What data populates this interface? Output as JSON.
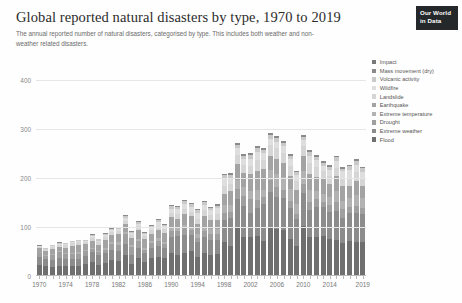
{
  "header": {
    "title": "Global reported natural disasters by type, 1970 to 2019",
    "subtitle": "The annual reported number of natural disasters, categorised by type. This includes both weather and non-weather related disasters.",
    "logo_line1": "Our World",
    "logo_line2": "in Data"
  },
  "chart_data": {
    "type": "bar",
    "stacked": true,
    "title": "Global reported natural disasters by type, 1970 to 2019",
    "subtitle": "The annual reported number of natural disasters, categorised by type. This includes both weather and non-weather related disasters.",
    "xlabel": "",
    "ylabel": "",
    "ylim": [
      0,
      440
    ],
    "yticks": [
      0,
      100,
      200,
      300,
      400
    ],
    "ytick_labels": [
      "0",
      "100",
      "200",
      "300",
      "400"
    ],
    "grid": true,
    "legend_position": "right",
    "categories": [
      1970,
      1971,
      1972,
      1973,
      1974,
      1975,
      1976,
      1977,
      1978,
      1979,
      1980,
      1981,
      1982,
      1983,
      1984,
      1985,
      1986,
      1987,
      1988,
      1989,
      1990,
      1991,
      1992,
      1993,
      1994,
      1995,
      1996,
      1997,
      1998,
      1999,
      2000,
      2001,
      2002,
      2003,
      2004,
      2005,
      2006,
      2007,
      2008,
      2009,
      2010,
      2011,
      2012,
      2013,
      2014,
      2015,
      2016,
      2017,
      2018,
      2019
    ],
    "xtick_labels": [
      "1970",
      "1974",
      "1978",
      "1982",
      "1986",
      "1990",
      "1994",
      "1998",
      "2002",
      "2006",
      "2010",
      "2014",
      "2019"
    ],
    "xticks": [
      1970,
      1974,
      1978,
      1982,
      1986,
      1990,
      1994,
      1998,
      2002,
      2006,
      2010,
      2014,
      2019
    ],
    "series": [
      {
        "name": "Flood",
        "color": "#6f6f6f",
        "values": [
          22,
          20,
          18,
          21,
          21,
          20,
          21,
          25,
          29,
          23,
          26,
          32,
          31,
          43,
          25,
          36,
          29,
          37,
          38,
          36,
          46,
          42,
          46,
          50,
          39,
          47,
          43,
          44,
          70,
          62,
          98,
          80,
          79,
          81,
          72,
          98,
          96,
          94,
          75,
          61,
          101,
          80,
          79,
          81,
          75,
          74,
          68,
          72,
          70,
          69
        ]
      },
      {
        "name": "Extreme weather",
        "color": "#8c8c8c",
        "values": [
          16,
          14,
          15,
          16,
          14,
          14,
          13,
          16,
          19,
          19,
          20,
          20,
          19,
          22,
          18,
          22,
          17,
          21,
          23,
          21,
          34,
          39,
          37,
          33,
          30,
          33,
          31,
          30,
          45,
          56,
          59,
          63,
          50,
          57,
          75,
          74,
          65,
          65,
          64,
          55,
          69,
          55,
          61,
          59,
          56,
          58,
          51,
          56,
          58,
          57
        ]
      },
      {
        "name": "Drought",
        "color": "#9f9f9f",
        "values": [
          6,
          7,
          9,
          12,
          9,
          10,
          11,
          9,
          7,
          6,
          8,
          13,
          14,
          20,
          16,
          13,
          8,
          9,
          10,
          8,
          12,
          11,
          14,
          11,
          9,
          11,
          12,
          11,
          14,
          13,
          20,
          20,
          27,
          16,
          14,
          23,
          20,
          16,
          14,
          11,
          18,
          16,
          16,
          11,
          14,
          19,
          17,
          13,
          14,
          13
        ]
      },
      {
        "name": "Extreme temperature",
        "color": "#b2b2b2",
        "values": [
          1,
          1,
          2,
          2,
          2,
          2,
          3,
          3,
          3,
          3,
          4,
          4,
          5,
          4,
          4,
          5,
          4,
          5,
          6,
          5,
          6,
          6,
          7,
          6,
          7,
          8,
          9,
          10,
          16,
          14,
          19,
          18,
          17,
          22,
          15,
          21,
          26,
          26,
          24,
          19,
          25,
          24,
          18,
          17,
          17,
          22,
          17,
          18,
          23,
          21
        ]
      },
      {
        "name": "Earthquake",
        "color": "#a3a3a3",
        "values": [
          12,
          9,
          11,
          9,
          12,
          16,
          16,
          12,
          14,
          13,
          16,
          14,
          16,
          17,
          14,
          18,
          17,
          13,
          17,
          18,
          22,
          19,
          23,
          22,
          21,
          23,
          19,
          20,
          22,
          28,
          32,
          28,
          35,
          39,
          42,
          29,
          32,
          30,
          26,
          30,
          32,
          32,
          28,
          29,
          26,
          31,
          30,
          25,
          29,
          24
        ]
      },
      {
        "name": "Landslide",
        "color": "#d5d5d5",
        "values": [
          3,
          4,
          5,
          4,
          5,
          5,
          5,
          4,
          6,
          5,
          6,
          7,
          6,
          7,
          6,
          7,
          6,
          8,
          8,
          7,
          9,
          10,
          10,
          9,
          11,
          12,
          11,
          12,
          17,
          15,
          18,
          17,
          16,
          21,
          19,
          21,
          22,
          19,
          21,
          18,
          20,
          23,
          21,
          17,
          16,
          16,
          17,
          16,
          17,
          15
        ]
      },
      {
        "name": "Wildfire",
        "color": "#dedede",
        "values": [
          1,
          1,
          1,
          2,
          2,
          2,
          2,
          2,
          3,
          3,
          3,
          3,
          4,
          5,
          4,
          5,
          4,
          6,
          8,
          6,
          8,
          9,
          9,
          10,
          12,
          10,
          9,
          11,
          14,
          12,
          15,
          13,
          15,
          16,
          13,
          14,
          13,
          15,
          14,
          11,
          12,
          14,
          13,
          11,
          13,
          15,
          13,
          17,
          15,
          14
        ]
      },
      {
        "name": "Volcanic activity",
        "color": "#c9c9c9",
        "values": [
          1,
          1,
          2,
          2,
          2,
          2,
          2,
          2,
          3,
          3,
          3,
          3,
          3,
          4,
          3,
          4,
          3,
          4,
          4,
          4,
          5,
          5,
          6,
          5,
          5,
          6,
          5,
          5,
          7,
          6,
          7,
          6,
          7,
          8,
          7,
          8,
          7,
          7,
          7,
          6,
          7,
          8,
          7,
          6,
          6,
          7,
          6,
          7,
          8,
          7
        ]
      },
      {
        "name": "Mass movement (dry)",
        "color": "#8a8a8a",
        "values": [
          1,
          1,
          1,
          1,
          1,
          1,
          1,
          1,
          1,
          1,
          1,
          1,
          1,
          2,
          1,
          2,
          1,
          2,
          2,
          2,
          2,
          2,
          3,
          2,
          2,
          3,
          2,
          3,
          3,
          3,
          4,
          3,
          4,
          4,
          3,
          4,
          4,
          4,
          3,
          3,
          4,
          4,
          3,
          3,
          3,
          3,
          3,
          3,
          4,
          3
        ]
      },
      {
        "name": "Impact",
        "color": "#787878",
        "values": [
          0,
          0,
          0,
          0,
          0,
          0,
          0,
          0,
          0,
          0,
          0,
          0,
          0,
          0,
          0,
          0,
          0,
          0,
          0,
          0,
          0,
          0,
          0,
          0,
          0,
          0,
          0,
          0,
          0,
          0,
          0,
          0,
          0,
          0,
          0,
          0,
          0,
          0,
          0,
          0,
          0,
          0,
          0,
          0,
          0,
          0,
          0,
          0,
          0,
          0
        ]
      }
    ]
  },
  "legend": {
    "items": [
      {
        "label": "Impact",
        "color": "#787878"
      },
      {
        "label": "Mass movement (dry)",
        "color": "#8a8a8a"
      },
      {
        "label": "Volcanic activity",
        "color": "#c9c9c9"
      },
      {
        "label": "Wildfire",
        "color": "#dedede"
      },
      {
        "label": "Landslide",
        "color": "#d5d5d5"
      },
      {
        "label": "Earthquake",
        "color": "#a3a3a3"
      },
      {
        "label": "Extreme temperature",
        "color": "#b2b2b2"
      },
      {
        "label": "Drought",
        "color": "#9f9f9f"
      },
      {
        "label": "Extreme weather",
        "color": "#8c8c8c"
      },
      {
        "label": "Flood",
        "color": "#6f6f6f"
      }
    ]
  }
}
